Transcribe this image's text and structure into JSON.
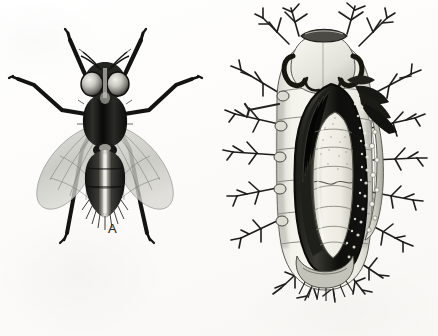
{
  "plate": {
    "background_color": "#fdfdfc",
    "ink_color": "#1c1c1a",
    "panel_count": 2
  },
  "panels": [
    {
      "id": "panel-a",
      "label": "A",
      "label_position": {
        "x": 108,
        "y": 221
      },
      "subject": "adult-fly-dorsal-view",
      "description": "Adult fly, dorsal view, wings spread, six legs extended",
      "parts": [
        "compound-eyes",
        "antennae",
        "thorax",
        "abdomen",
        "left-wing",
        "right-wing",
        "fore-legs",
        "mid-legs",
        "hind-legs"
      ]
    },
    {
      "id": "panel-b",
      "label": "B",
      "label_position": {
        "x": 328,
        "y": 300
      },
      "subject": "spiny-larva-dissected-with-puparium",
      "description": "Spiny caterpillar host opened dorsally to reveal internal puparium",
      "parts": [
        "head-capsule",
        "mandibular-hooks",
        "branched-spines",
        "body-segments",
        "dissection-cavity",
        "internal-puparium",
        "posterior-end"
      ]
    }
  ],
  "colors": {
    "paper": "#fdfdfc",
    "ink_dark": "#1b1b19",
    "ink_mid": "#6a6a66",
    "wing_gray": "#b9b9b4",
    "larva_body": "#efeee9",
    "cavity_black": "#141412",
    "pupa_pale": "#f2f1ea"
  }
}
